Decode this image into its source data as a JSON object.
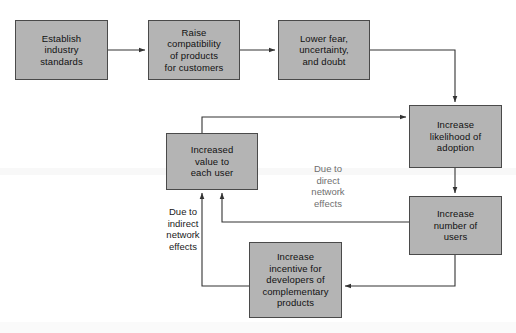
{
  "diagram": {
    "colors": {
      "box_fill": "#b4b4b4",
      "box_border": "#4a4a4a",
      "line": "#333333",
      "background": "#ffffff",
      "text": "#111111"
    },
    "nodes": [
      {
        "id": "establish",
        "label": "Establish\nindustry\nstandards",
        "x": 15,
        "y": 20,
        "w": 93,
        "h": 60
      },
      {
        "id": "compat",
        "label": "Raise\ncompatibility\nof products\nfor customers",
        "x": 148,
        "y": 20,
        "w": 92,
        "h": 60
      },
      {
        "id": "fear",
        "label": "Lower fear,\nuncertainty,\nand doubt",
        "x": 278,
        "y": 20,
        "w": 92,
        "h": 60
      },
      {
        "id": "adoption",
        "label": "Increase\nlikelihood of\nadoption",
        "x": 409,
        "y": 105,
        "w": 93,
        "h": 63
      },
      {
        "id": "users",
        "label": "Increase\nnumber of\nusers",
        "x": 409,
        "y": 196,
        "w": 93,
        "h": 59
      },
      {
        "id": "value",
        "label": "Increased\nvalue to\neach user",
        "x": 166,
        "y": 133,
        "w": 92,
        "h": 57
      },
      {
        "id": "incentive",
        "label": "Increase\nincentive for\ndevelopers of\ncomplementary\nproducts",
        "x": 249,
        "y": 242,
        "w": 93,
        "h": 76
      }
    ],
    "edge_labels": [
      {
        "id": "direct",
        "text": "Due to\ndirect\nnetwork\neffects",
        "x": 297,
        "y": 163,
        "w": 62
      },
      {
        "id": "indirect",
        "text": "Due to\nindirect\nnetwork\neffects",
        "x": 155,
        "y": 206,
        "w": 56
      }
    ],
    "edges": [
      {
        "id": "establish-to-compat",
        "from": "establish",
        "to": "compat",
        "label": ""
      },
      {
        "id": "compat-to-fear",
        "from": "compat",
        "to": "fear",
        "label": ""
      },
      {
        "id": "fear-to-adoption",
        "from": "fear",
        "to": "adoption",
        "label": ""
      },
      {
        "id": "adoption-to-users",
        "from": "adoption",
        "to": "users",
        "label": ""
      },
      {
        "id": "users-to-value",
        "from": "users",
        "to": "value",
        "label": "Due to direct network effects"
      },
      {
        "id": "users-to-incentive",
        "from": "users",
        "to": "incentive",
        "label": ""
      },
      {
        "id": "incentive-to-value",
        "from": "incentive",
        "to": "value",
        "label": "Due to indirect network effects"
      },
      {
        "id": "value-to-adoption",
        "from": "value",
        "to": "adoption",
        "label": ""
      }
    ]
  }
}
